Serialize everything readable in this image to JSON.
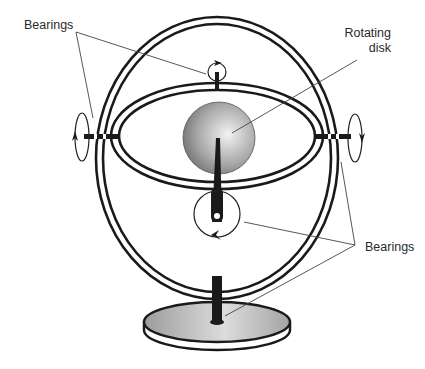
{
  "diagram": {
    "labels": {
      "bearings_top": "Bearings",
      "rotating_disk_line1": "Rotating",
      "rotating_disk_line2": "disk",
      "bearings_bottom": "Bearings"
    },
    "components": [
      "outer-gimbal-ring",
      "inner-gimbal-ring",
      "rotating-disk",
      "spin-axle",
      "top-bearing",
      "bottom-bearing",
      "left-pivot-bearing",
      "right-pivot-bearing",
      "stand-post",
      "stand-base"
    ],
    "colors": {
      "line": "#1a1a1a",
      "leader": "#444444",
      "disk_light": "#e8e8e8",
      "disk_dark": "#6a6a6a",
      "base_fill": "#b8b8b8"
    }
  }
}
